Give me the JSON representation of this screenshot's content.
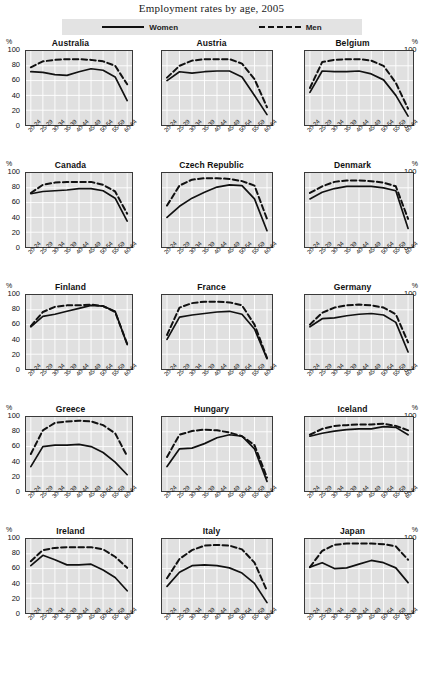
{
  "title": "Employment rates by age, 2005",
  "legend": {
    "items": [
      {
        "label": "Women",
        "style": "solid",
        "icon": "solid-line-icon"
      },
      {
        "label": "Men",
        "style": "dashed",
        "icon": "dashed-line-icon"
      }
    ]
  },
  "axis": {
    "unit": "%",
    "y_ticks": [
      "100",
      "80",
      "60",
      "40",
      "20",
      "0"
    ],
    "x_ticks": [
      "20-24",
      "25-29",
      "30-34",
      "35-39",
      "40-44",
      "45-49",
      "50-54",
      "55-59",
      "60-64"
    ]
  },
  "panels": [
    "Australia",
    "Austria",
    "Belgium",
    "Canada",
    "Czech Republic",
    "Denmark",
    "Finland",
    "France",
    "Germany",
    "Greece",
    "Hungary",
    "Iceland",
    "Ireland",
    "Italy",
    "Japan"
  ],
  "chart_data": {
    "type": "line",
    "title": "Employment rates by age, 2005",
    "xlabel": "",
    "ylabel": "%",
    "ylim": [
      0,
      100
    ],
    "grid": true,
    "legend_position": "top",
    "categories": [
      "20-24",
      "25-29",
      "30-34",
      "35-39",
      "40-44",
      "45-49",
      "50-54",
      "55-59",
      "60-64"
    ],
    "panels": [
      {
        "name": "Australia",
        "series": [
          {
            "name": "Women",
            "style": "solid",
            "values": [
              72,
              71,
              68,
              67,
              72,
              76,
              74,
              65,
              33
            ]
          },
          {
            "name": "Men",
            "style": "dashed",
            "values": [
              78,
              86,
              88,
              89,
              89,
              88,
              86,
              80,
              55
            ]
          }
        ]
      },
      {
        "name": "Austria",
        "series": [
          {
            "name": "Women",
            "style": "solid",
            "values": [
              60,
              72,
              70,
              72,
              73,
              73,
              65,
              40,
              14
            ]
          },
          {
            "name": "Men",
            "style": "dashed",
            "values": [
              64,
              80,
              87,
              89,
              89,
              89,
              83,
              62,
              24
            ]
          }
        ]
      },
      {
        "name": "Belgium",
        "series": [
          {
            "name": "Women",
            "style": "solid",
            "values": [
              44,
              73,
              72,
              72,
              73,
              69,
              61,
              40,
              12
            ]
          },
          {
            "name": "Men",
            "style": "dashed",
            "values": [
              50,
              85,
              88,
              89,
              89,
              87,
              80,
              57,
              22
            ]
          }
        ]
      },
      {
        "name": "Canada",
        "series": [
          {
            "name": "Women",
            "style": "solid",
            "values": [
              72,
              75,
              76,
              77,
              79,
              79,
              76,
              66,
              35
            ]
          },
          {
            "name": "Men",
            "style": "dashed",
            "values": [
              73,
              84,
              87,
              88,
              88,
              88,
              84,
              75,
              45
            ]
          }
        ]
      },
      {
        "name": "Czech Republic",
        "series": [
          {
            "name": "Women",
            "style": "solid",
            "values": [
              40,
              55,
              66,
              74,
              81,
              84,
              83,
              65,
              22
            ]
          },
          {
            "name": "Men",
            "style": "dashed",
            "values": [
              56,
              83,
              91,
              93,
              93,
              92,
              89,
              83,
              38
            ]
          }
        ]
      },
      {
        "name": "Denmark",
        "series": [
          {
            "name": "Women",
            "style": "solid",
            "values": [
              65,
              74,
              79,
              82,
              82,
              82,
              80,
              76,
              25
            ]
          },
          {
            "name": "Men",
            "style": "dashed",
            "values": [
              73,
              82,
              88,
              90,
              90,
              89,
              87,
              82,
              38
            ]
          }
        ]
      },
      {
        "name": "Finland",
        "series": [
          {
            "name": "Women",
            "style": "solid",
            "values": [
              57,
              71,
              74,
              78,
              82,
              86,
              85,
              78,
              33
            ]
          },
          {
            "name": "Men",
            "style": "dashed",
            "values": [
              58,
              77,
              84,
              86,
              86,
              87,
              85,
              77,
              34
            ]
          }
        ]
      },
      {
        "name": "France",
        "series": [
          {
            "name": "Women",
            "style": "solid",
            "values": [
              40,
              70,
              73,
              75,
              77,
              78,
              74,
              54,
              14
            ]
          },
          {
            "name": "Men",
            "style": "dashed",
            "values": [
              46,
              83,
              89,
              91,
              91,
              90,
              86,
              60,
              15
            ]
          }
        ]
      },
      {
        "name": "Germany",
        "series": [
          {
            "name": "Women",
            "style": "solid",
            "values": [
              57,
              68,
              69,
              72,
              74,
              75,
              73,
              63,
              23
            ]
          },
          {
            "name": "Men",
            "style": "dashed",
            "values": [
              60,
              76,
              83,
              86,
              87,
              86,
              83,
              74,
              36
            ]
          }
        ]
      },
      {
        "name": "Greece",
        "series": [
          {
            "name": "Women",
            "style": "solid",
            "values": [
              33,
              60,
              62,
              62,
              63,
              60,
              52,
              39,
              22
            ]
          },
          {
            "name": "Men",
            "style": "dashed",
            "values": [
              50,
              82,
              92,
              94,
              95,
              94,
              89,
              78,
              47
            ]
          }
        ]
      },
      {
        "name": "Hungary",
        "series": [
          {
            "name": "Women",
            "style": "solid",
            "values": [
              33,
              57,
              58,
              64,
              72,
              76,
              74,
              57,
              13
            ]
          },
          {
            "name": "Men",
            "style": "dashed",
            "values": [
              46,
              76,
              81,
              83,
              82,
              79,
              74,
              62,
              18
            ]
          }
        ]
      },
      {
        "name": "Iceland",
        "series": [
          {
            "name": "Women",
            "style": "solid",
            "values": [
              74,
              78,
              81,
              83,
              84,
              84,
              87,
              86,
              76
            ]
          },
          {
            "name": "Men",
            "style": "dashed",
            "values": [
              76,
              84,
              88,
              89,
              90,
              90,
              91,
              88,
              82
            ]
          }
        ]
      },
      {
        "name": "Ireland",
        "series": [
          {
            "name": "Women",
            "style": "solid",
            "values": [
              64,
              78,
              72,
              65,
              65,
              66,
              58,
              48,
              30
            ]
          },
          {
            "name": "Men",
            "style": "dashed",
            "values": [
              70,
              85,
              88,
              89,
              89,
              89,
              86,
              76,
              61
            ]
          }
        ]
      },
      {
        "name": "Italy",
        "series": [
          {
            "name": "Women",
            "style": "solid",
            "values": [
              36,
              55,
              64,
              65,
              64,
              61,
              54,
              40,
              14
            ]
          },
          {
            "name": "Men",
            "style": "dashed",
            "values": [
              47,
              73,
              85,
              91,
              92,
              91,
              86,
              68,
              30
            ]
          }
        ]
      },
      {
        "name": "Japan",
        "series": [
          {
            "name": "Women",
            "style": "solid",
            "values": [
              62,
              68,
              60,
              61,
              66,
              71,
              68,
              61,
              41
            ]
          },
          {
            "name": "Men",
            "style": "dashed",
            "values": [
              62,
              84,
              92,
              94,
              94,
              94,
              93,
              90,
              72
            ]
          }
        ]
      }
    ]
  }
}
